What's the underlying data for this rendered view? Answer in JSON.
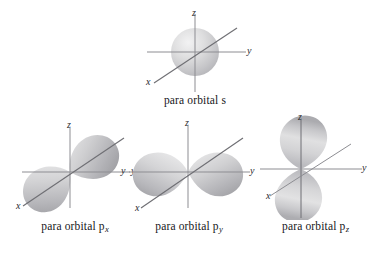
{
  "figure": {
    "background_color": "#ffffff",
    "orbital_fill_light": "#e9e9ea",
    "orbital_fill_mid": "#c9c9cb",
    "orbital_fill_dark": "#a7a7aa",
    "axis_color": "#8d8d92",
    "text_color": "#17171a"
  },
  "panels": [
    {
      "id": "s",
      "caption_prefix": "para orbital s",
      "caption_sub": "",
      "shape": "sphere",
      "axes": [
        {
          "name": "z-axis-label",
          "label": "z"
        },
        {
          "name": "y-axis-label",
          "label": "y"
        },
        {
          "name": "x-axis-label",
          "label": "x"
        }
      ]
    },
    {
      "id": "px",
      "caption_prefix": "para orbital p",
      "caption_sub": "x",
      "shape": "two-lobes-along-x",
      "axes": [
        {
          "name": "z-axis-label",
          "label": "z"
        },
        {
          "name": "y-axis-label",
          "label": "y"
        },
        {
          "name": "x-axis-label",
          "label": "x"
        }
      ]
    },
    {
      "id": "py",
      "caption_prefix": "para orbital p",
      "caption_sub": "y",
      "shape": "two-lobes-along-y",
      "axes": [
        {
          "name": "z-axis-label",
          "label": "z"
        },
        {
          "name": "y-axis-label-right",
          "label": "y"
        },
        {
          "name": "y-axis-label-left",
          "label": "y"
        },
        {
          "name": "x-axis-label",
          "label": "x"
        }
      ]
    },
    {
      "id": "pz",
      "caption_prefix": "para orbital p",
      "caption_sub": "z",
      "shape": "two-lobes-along-z",
      "axes": [
        {
          "name": "z-axis-label",
          "label": "z"
        },
        {
          "name": "y-axis-label",
          "label": "y"
        },
        {
          "name": "x-axis-label",
          "label": "x"
        }
      ]
    }
  ]
}
